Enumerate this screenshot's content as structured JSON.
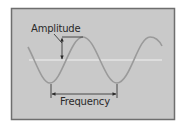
{
  "diagram": {
    "colors": {
      "frame_border": "#6e6e6e",
      "frame_fill": "#c9c9c9",
      "wave": "#9a9a9a",
      "center_line": "#f2f2f2",
      "annotation": "#2a2a2a"
    },
    "labels": {
      "amplitude": "Amplitude",
      "frequency": "Frequency"
    }
  }
}
